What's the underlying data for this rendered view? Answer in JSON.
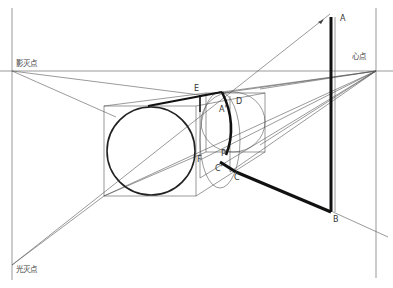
{
  "diagram": {
    "title": "",
    "labels": {
      "shadow_vanishing_point": "影灭点",
      "center_point": "心点",
      "light_vanishing_point": "光灭点",
      "A_top": "A",
      "A_prime": "A'",
      "B": "B",
      "C": "C",
      "C_prime": "C'",
      "D": "D",
      "E": "E",
      "F": "F",
      "P_prime": "P'"
    },
    "colors": {
      "background": "#ffffff",
      "lines": "#555555",
      "bold_lines": "#111111"
    }
  }
}
